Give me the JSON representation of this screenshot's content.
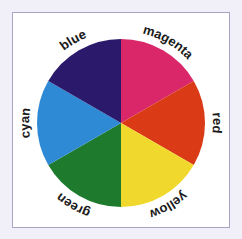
{
  "diagram": {
    "center": {
      "x": 121,
      "y": 123
    },
    "radius": 84,
    "label_radius": 92,
    "segments": [
      {
        "name": "magenta",
        "label": "magenta",
        "color": "#d9276a",
        "start_deg": 0,
        "end_deg": 60
      },
      {
        "name": "red",
        "label": "red",
        "color": "#db3a17",
        "start_deg": 60,
        "end_deg": 120
      },
      {
        "name": "yellow",
        "label": "yellow",
        "color": "#f0d92c",
        "start_deg": 120,
        "end_deg": 180
      },
      {
        "name": "green",
        "label": "green",
        "color": "#1e7b2e",
        "start_deg": 180,
        "end_deg": 240
      },
      {
        "name": "cyan",
        "label": "cyan",
        "color": "#2f8ad6",
        "start_deg": 240,
        "end_deg": 300
      },
      {
        "name": "blue",
        "label": "blue",
        "color": "#2b1a6b",
        "start_deg": 300,
        "end_deg": 360
      }
    ]
  },
  "colors": {
    "background": "#f1f0f8",
    "frame_fill": "#ffffff",
    "frame_border": "#a6a6c8",
    "label_text": "#1a1a1a"
  }
}
